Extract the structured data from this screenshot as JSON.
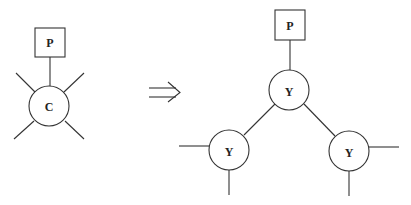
{
  "diagram": {
    "left": {
      "box_label": "P",
      "center_label": "C"
    },
    "arrow": "⇒",
    "right": {
      "box_label": "P",
      "top_label": "Y",
      "left_label": "Y",
      "right_label": "Y"
    }
  },
  "colors": {
    "stroke": "#333333",
    "background": "#ffffff"
  }
}
